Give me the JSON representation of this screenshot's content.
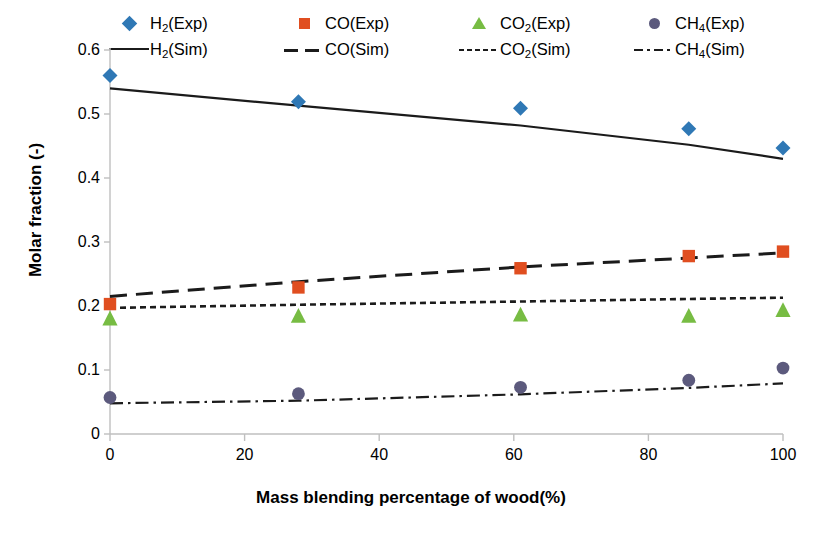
{
  "chart_data": {
    "type": "scatter",
    "title": "",
    "xlabel": "Mass blending percentage of wood(%)",
    "ylabel": "Molar fraction (-)",
    "xlim": [
      0,
      100
    ],
    "ylim": [
      0,
      0.6
    ],
    "xticks": [
      "0",
      "20",
      "40",
      "60",
      "80",
      "100"
    ],
    "xtick_values": [
      0,
      20,
      40,
      60,
      80,
      100
    ],
    "yticks": [
      "0",
      "0.1",
      "0.2",
      "0.3",
      "0.4",
      "0.5",
      "0.6"
    ],
    "ytick_values": [
      0,
      0.1,
      0.2,
      0.3,
      0.4,
      0.5,
      0.6
    ],
    "grid": false,
    "legend_position": "top",
    "x": [
      0,
      28,
      61,
      86,
      100
    ],
    "series": [
      {
        "name": "H2(Exp)",
        "kind": "scatter",
        "marker": "diamond",
        "color": "#2f78b5",
        "values": [
          0.56,
          0.519,
          0.509,
          0.477,
          0.447
        ]
      },
      {
        "name": "CO(Exp)",
        "kind": "scatter",
        "marker": "square",
        "color": "#e04e20",
        "values": [
          0.203,
          0.229,
          0.259,
          0.278,
          0.285
        ]
      },
      {
        "name": "CO2(Exp)",
        "kind": "scatter",
        "marker": "triangle",
        "color": "#77bc43",
        "values": [
          0.181,
          0.185,
          0.187,
          0.185,
          0.194
        ]
      },
      {
        "name": "CH4(Exp)",
        "kind": "scatter",
        "marker": "circle",
        "color": "#5c5a7d",
        "values": [
          0.057,
          0.063,
          0.073,
          0.084,
          0.103
        ]
      },
      {
        "name": "H2(Sim)",
        "kind": "line",
        "linestyle": "solid",
        "color": "#1b1b1b",
        "x": [
          0,
          28,
          61,
          86,
          100
        ],
        "values": [
          0.54,
          0.513,
          0.482,
          0.452,
          0.43
        ]
      },
      {
        "name": "CO(Sim)",
        "kind": "line",
        "linestyle": "dashed",
        "color": "#1b1b1b",
        "x": [
          0,
          28,
          61,
          86,
          100
        ],
        "values": [
          0.215,
          0.238,
          0.261,
          0.275,
          0.283
        ]
      },
      {
        "name": "CO2(Sim)",
        "kind": "line",
        "linestyle": "dotted",
        "color": "#1b1b1b",
        "x": [
          0,
          28,
          61,
          86,
          100
        ],
        "values": [
          0.197,
          0.202,
          0.207,
          0.211,
          0.213
        ]
      },
      {
        "name": "CH4(Sim)",
        "kind": "line",
        "linestyle": "dashdot",
        "color": "#1b1b1b",
        "x": [
          0,
          28,
          61,
          86,
          100
        ],
        "values": [
          0.048,
          0.052,
          0.062,
          0.072,
          0.079
        ]
      }
    ]
  },
  "legend": {
    "row1": [
      {
        "label_main": "H",
        "label_sub": "2",
        "label_rest": "(Exp)",
        "marker": "diamond-marker"
      },
      {
        "label_main": "CO",
        "label_sub": "",
        "label_rest": "(Exp)",
        "marker": "square-marker"
      },
      {
        "label_main": "CO",
        "label_sub": "2",
        "label_rest": "(Exp)",
        "marker": "triangle-marker"
      },
      {
        "label_main": "CH",
        "label_sub": "4",
        "label_rest": "(Exp)",
        "marker": "circle-marker"
      }
    ],
    "row2": [
      {
        "label_main": "H",
        "label_sub": "2",
        "label_rest": "(Sim)",
        "marker": "solid-line"
      },
      {
        "label_main": "CO",
        "label_sub": "",
        "label_rest": "(Sim)",
        "marker": "dashed-line"
      },
      {
        "label_main": "CO",
        "label_sub": "2",
        "label_rest": "(Sim)",
        "marker": "dotted-line"
      },
      {
        "label_main": "CH",
        "label_sub": "4",
        "label_rest": "(Sim)",
        "marker": "dashdot-line"
      }
    ]
  },
  "axes": {
    "y_title": "Molar fraction (-)",
    "x_title": "Mass blending percentage of wood(%)"
  }
}
